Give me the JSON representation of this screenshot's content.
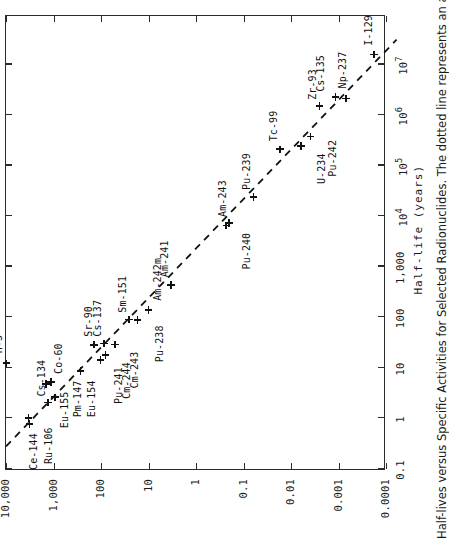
{
  "figure": {
    "caption": "Half-lives versus Specific Activities for Selected Radionuclides.  The dotted line represents an approxi"
  },
  "chart_data": {
    "type": "scatter",
    "title": "Half-lives versus Specific Activities for Selected Radionuclides",
    "xlabel": "Half-life (years)",
    "ylabel": "",
    "xscale": "log",
    "yscale": "log",
    "xlim": [
      0.1,
      100000000
    ],
    "ylim": [
      0.0001,
      10000
    ],
    "grid": false,
    "legend": "none",
    "xticklabels": [
      "0.1",
      "1",
      "10",
      "100",
      "1,000",
      "10⁴",
      "10⁵",
      "10⁶",
      "10⁷"
    ],
    "xtickvalues": [
      0.1,
      1,
      10,
      100,
      1000,
      10000,
      100000,
      1000000,
      10000000
    ],
    "yticklabels": [
      "10,000",
      "1,000",
      "100",
      "10",
      "1",
      "0.1",
      "0.01",
      "0.001",
      "0.0001"
    ],
    "ytickvalues": [
      10000,
      1000,
      100,
      10,
      1,
      0.1,
      0.01,
      0.001,
      0.0001
    ],
    "annotation": "dotted trend line",
    "points": [
      {
        "label": "H-3",
        "x": 12.3,
        "y": 9700,
        "lx": 10,
        "ly": -14
      },
      {
        "label": "Ce-144",
        "x": 0.78,
        "y": 3200,
        "lx": -46,
        "ly": -2
      },
      {
        "label": "Ru-106",
        "x": 1.02,
        "y": 3350,
        "lx": -46,
        "ly": 14
      },
      {
        "label": "Cs-134",
        "x": 2.06,
        "y": 1300,
        "lx": 6,
        "ly": -12
      },
      {
        "label": "Eu-155",
        "x": 4.75,
        "y": 1450,
        "lx": -44,
        "ly": 13
      },
      {
        "label": "Co-60",
        "x": 5.27,
        "y": 1130,
        "lx": 8,
        "ly": 2
      },
      {
        "label": "Pm-147",
        "x": 2.62,
        "y": 930,
        "lx": -20,
        "ly": 17
      },
      {
        "label": "Eu-154",
        "x": 8.6,
        "y": 270,
        "lx": -46,
        "ly": 5
      },
      {
        "label": "Sr-90",
        "x": 28.8,
        "y": 140,
        "lx": 8,
        "ly": -11
      },
      {
        "label": "Pu-241",
        "x": 14.4,
        "y": 103,
        "lx": -44,
        "ly": 13
      },
      {
        "label": "Cs-137",
        "x": 30.2,
        "y": 87,
        "lx": 7,
        "ly": -12
      },
      {
        "label": "Cm-244",
        "x": 18.1,
        "y": 81,
        "lx": -44,
        "ly": 16
      },
      {
        "label": "Sm-151",
        "x": 90,
        "y": 26,
        "lx": 7,
        "ly": -12
      },
      {
        "label": "Cm-243",
        "x": 29.1,
        "y": 51,
        "lx": -44,
        "ly": 14
      },
      {
        "label": "Am-241",
        "x": 432,
        "y": 3.4,
        "lx": 8,
        "ly": -12
      },
      {
        "label": "Pu-238",
        "x": 87.7,
        "y": 17,
        "lx": -42,
        "ly": 16
      },
      {
        "label": "Am-242m",
        "x": 141,
        "y": 10,
        "lx": 9,
        "ly": 3
      },
      {
        "label": "Pu-240",
        "x": 6560,
        "y": 0.23,
        "lx": -44,
        "ly": 15
      },
      {
        "label": "Am-243",
        "x": 7370,
        "y": 0.2,
        "lx": 6,
        "ly": -12
      },
      {
        "label": "Pu-239",
        "x": 24100,
        "y": 0.062,
        "lx": 7,
        "ly": -12
      },
      {
        "label": "Tc-99",
        "x": 211000,
        "y": 0.017,
        "lx": 8,
        "ly": -12
      },
      {
        "label": "U-234",
        "x": 245000,
        "y": 0.0062,
        "lx": -38,
        "ly": 15
      },
      {
        "label": "Pu-242",
        "x": 375000,
        "y": 0.0039,
        "lx": -40,
        "ly": 17
      },
      {
        "label": "Zr-93",
        "x": 1530000,
        "y": 0.0025,
        "lx": 6,
        "ly": -13
      },
      {
        "label": "Cs-135",
        "x": 2300000,
        "y": 0.00115,
        "lx": 5,
        "ly": -21
      },
      {
        "label": "Np-237",
        "x": 2140000,
        "y": 0.0007,
        "lx": 10,
        "ly": -9
      },
      {
        "label": "I-129",
        "x": 15700000,
        "y": 0.000177,
        "lx": 9,
        "ly": -11
      }
    ],
    "trendline": {
      "x": [
        0.28,
        31000000
      ],
      "y": [
        10000,
        6e-05
      ],
      "style": "dashed"
    }
  }
}
